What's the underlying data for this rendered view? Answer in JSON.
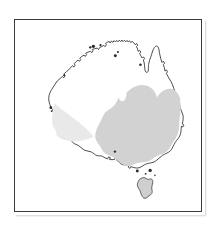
{
  "figure": {
    "kind": "distribution-map",
    "region": "Australia",
    "caption": "",
    "background_color": "#ffffff",
    "frame": {
      "visible": true,
      "border_color": "#3a3a3a",
      "border_width_px": 1.5,
      "x": 14,
      "y": 19,
      "width": 188,
      "height": 193
    }
  },
  "map": {
    "title": "",
    "coastline": {
      "name": "Australia mainland coastline",
      "fill_color": "#ffffff",
      "stroke_color": "#2b2b2b",
      "stroke_width": 0.85
    },
    "islands": [
      {
        "name": "Tasmania",
        "shaded": false,
        "fill_color": "#cfcfcf"
      },
      {
        "name": "Bass Strait islet north-west",
        "shaded": false
      },
      {
        "name": "Bass Strait islet north-east",
        "shaded": false
      },
      {
        "name": "Kangaroo Island",
        "shaded": false
      },
      {
        "name": "Melville Island",
        "shaded": false
      },
      {
        "name": "Groote Eylandt",
        "shaded": false
      }
    ],
    "ranges": [
      {
        "name": "primary-distribution-range",
        "label": "Main distribution",
        "color": "#d2d2d2",
        "description": "Continuous shaded range covering eastern Australia: most of Queensland inland of Cape York, all of New South Wales, Victoria, the south-east corner of South Australia and eastern fringe of the Northern Territory border.",
        "density": "dense",
        "states_covered": [
          "Queensland",
          "New South Wales",
          "Victoria",
          "South Australia (east)"
        ]
      },
      {
        "name": "secondary-distribution-range",
        "label": "Outlying / sparse distribution",
        "color": "#e9e9e9",
        "description": "Faint wedge-shaped shading in south-west Western Australia, tapering north-east from the south-west coastal corner.",
        "density": "sparse",
        "states_covered": [
          "Western Australia (south-west)"
        ]
      }
    ],
    "excluded_areas": [
      "Tasmania",
      "Cape York Peninsula tip",
      "Central and western desert interior",
      "Kimberley",
      "Pilbara",
      "Nullarbor / Great Australian Bight hinterland"
    ],
    "legend": {
      "visible": false,
      "entries": []
    },
    "scale_bar": {
      "visible": false
    },
    "north_arrow": {
      "visible": false
    },
    "graticule": {
      "visible": false
    },
    "labels": []
  }
}
